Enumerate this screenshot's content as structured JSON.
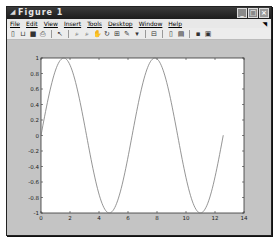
{
  "window": {
    "title": "Figure 1",
    "title_icon": "matlab-figure-icon",
    "controls": [
      "minimize",
      "maximize",
      "close"
    ]
  },
  "menubar": {
    "items": [
      "File",
      "Edit",
      "View",
      "Insert",
      "Tools",
      "Desktop",
      "Window",
      "Help"
    ]
  },
  "toolbar": {
    "buttons": [
      "new-figure",
      "open-file",
      "save",
      "print",
      "edit-plot",
      "zoom-in",
      "zoom-out",
      "pan",
      "rotate-3d",
      "data-cursor",
      "brush",
      "link",
      "insert-colorbar",
      "insert-legend",
      "hide-plot-tools",
      "show-plot-tools"
    ]
  },
  "chart_data": {
    "type": "line",
    "title": "",
    "xlabel": "",
    "ylabel": "",
    "xlim": [
      0,
      14
    ],
    "ylim": [
      -1,
      1
    ],
    "xticks": [
      "0",
      "2",
      "4",
      "6",
      "8",
      "10",
      "12",
      "14"
    ],
    "yticks": [
      "-1",
      "-0.8",
      "-0.6",
      "-0.4",
      "-0.2",
      "0",
      "0.2",
      "0.4",
      "0.6",
      "0.8",
      "1"
    ],
    "grid": false,
    "legend": null,
    "series": [
      {
        "name": "sin(x)",
        "function": "y = sin(x)",
        "x_range": [
          0,
          12.57
        ],
        "color": "#7a7a7a",
        "x": [
          0,
          1,
          1.571,
          2,
          3,
          3.142,
          4,
          4.712,
          5,
          6,
          6.283,
          7,
          7.854,
          8,
          9,
          9.425,
          10,
          10.996,
          11,
          12,
          12.57
        ],
        "y": [
          0,
          0.841,
          1,
          0.909,
          0.141,
          0,
          -0.757,
          -1,
          -0.959,
          -0.279,
          0,
          0.657,
          1,
          0.989,
          0.412,
          0,
          -0.544,
          -1,
          -1,
          -0.537,
          0
        ]
      }
    ]
  },
  "colors": {
    "titlebar": "#1c1c1c",
    "figure_bg": "#c4c4c4",
    "axes_bg": "#ffffff",
    "line": "#7a7a7a"
  }
}
